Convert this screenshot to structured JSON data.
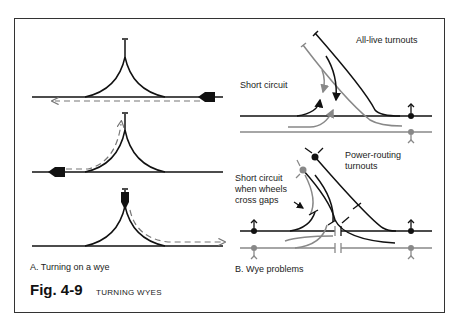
{
  "figure": {
    "number": "Fig. 4-9",
    "title": "TURNING WYES"
  },
  "panel_a": {
    "caption": "A. Turning on a wye",
    "steps": [
      {
        "name": "approach",
        "description": "Locomotive on main line, dashed path left along main"
      },
      {
        "name": "reverse-up-leg",
        "description": "Locomotive facing left, dashed path curving up into tail track"
      },
      {
        "name": "exit-other-leg",
        "description": "Locomotive in tail track, dashed path down the right leg"
      }
    ]
  },
  "panel_b": {
    "caption": "B. Wye problems",
    "upper": {
      "title": "All-live turnouts",
      "annotation": "Short circuit"
    },
    "lower": {
      "title_line1": "Power-routing",
      "title_line2": "turnouts",
      "annotation_line1": "Short circuit",
      "annotation_line2": "when wheels",
      "annotation_line3": "cross gaps"
    }
  },
  "colors": {
    "rail_black": "#111111",
    "rail_gray": "#8a8a8a",
    "dashed_path": "#777777",
    "frame": "#333333"
  }
}
